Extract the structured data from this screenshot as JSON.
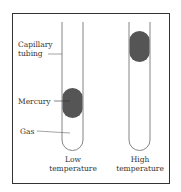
{
  "diagram": {
    "labels": {
      "capillary_line1": "Capillary",
      "capillary_line2": "tubing",
      "mercury": "Mercury",
      "gas": "Gas"
    },
    "tubes": [
      {
        "caption_line1": "Low",
        "caption_line2": "temperature",
        "mercury_position": "low"
      },
      {
        "caption_line1": "High",
        "caption_line2": "temperature",
        "mercury_position": "high"
      }
    ],
    "colors": {
      "mercury": "#555555",
      "line": "#666666",
      "frame": "#333333"
    }
  }
}
